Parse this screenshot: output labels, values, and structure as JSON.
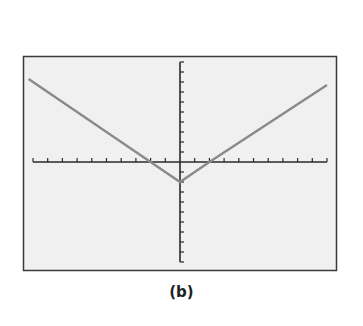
{
  "caption": "(b)",
  "colors": {
    "frame_stroke": "#3a3a3a",
    "screen_bg": "#f0f0f0",
    "axis": "#2a2a2a",
    "curve": "#8a8a8a"
  },
  "chart_data": {
    "type": "line",
    "title": "",
    "caption": "(b)",
    "xlabel": "",
    "ylabel": "",
    "function": "y = |x| - 2",
    "xlim": [
      -10,
      10
    ],
    "ylim": [
      -10,
      10
    ],
    "xscl": 1,
    "yscl": 1,
    "grid": false,
    "legend": null,
    "x": [
      -10.3,
      -2,
      0,
      2,
      10
    ],
    "y": [
      8.3,
      0,
      -2,
      0,
      7.7
    ],
    "vertex": [
      0,
      -2
    ],
    "x_intercepts": [
      -2,
      2
    ],
    "y_intercept": -2
  }
}
